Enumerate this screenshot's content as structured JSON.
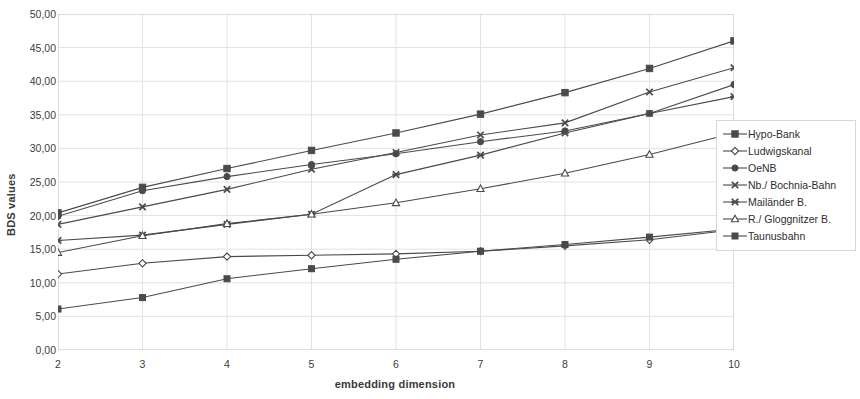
{
  "chart_data": {
    "type": "line",
    "title": "",
    "xlabel": "embedding dimension",
    "ylabel": "BDS values",
    "x": [
      2,
      3,
      4,
      5,
      6,
      7,
      8,
      9,
      10
    ],
    "xlim": [
      2,
      10
    ],
    "ylim": [
      0,
      50
    ],
    "xtick_labels": [
      "2",
      "3",
      "4",
      "5",
      "6",
      "7",
      "8",
      "9",
      "10"
    ],
    "ytick_labels": [
      "0,00",
      "5,00",
      "10,00",
      "15,00",
      "20,00",
      "25,00",
      "30,00",
      "35,00",
      "40,00",
      "45,00",
      "50,00"
    ],
    "ytick_values": [
      0,
      5,
      10,
      15,
      20,
      25,
      30,
      35,
      40,
      45,
      50
    ],
    "grid": true,
    "legend_position": "right",
    "series": [
      {
        "name": "Hypo-Bank",
        "marker": "filled-square",
        "values": [
          20.4,
          24.2,
          27.0,
          29.7,
          32.3,
          35.1,
          38.3,
          41.9,
          46.0
        ]
      },
      {
        "name": "Ludwigskanal",
        "marker": "open-diamond",
        "values": [
          11.3,
          12.9,
          13.9,
          14.1,
          14.3,
          14.7,
          15.5,
          16.4,
          17.9
        ]
      },
      {
        "name": "OeNB",
        "marker": "filled-circle",
        "values": [
          19.9,
          23.7,
          25.8,
          27.6,
          29.2,
          31.0,
          32.6,
          35.2,
          39.5
        ]
      },
      {
        "name": "Nb./ Bochnia-Bahn",
        "marker": "x-cross",
        "values": [
          18.7,
          21.3,
          23.9,
          26.9,
          29.4,
          32.0,
          33.8,
          38.4,
          42.0
        ]
      },
      {
        "name": "Mailänder B.",
        "marker": "star-cross",
        "values": [
          16.3,
          17.1,
          18.7,
          20.2,
          26.1,
          29.0,
          32.3,
          35.2,
          37.7
        ]
      },
      {
        "name": "R./ Gloggnitzer B.",
        "marker": "open-triangle",
        "values": [
          14.5,
          17.0,
          18.8,
          20.2,
          21.9,
          24.0,
          26.3,
          29.1,
          32.3
        ]
      },
      {
        "name": "Taunusbahn",
        "marker": "filled-square-small",
        "values": [
          6.1,
          7.8,
          10.6,
          12.1,
          13.5,
          14.7,
          15.7,
          16.8,
          18.0
        ]
      }
    ]
  },
  "legend": {
    "items": [
      {
        "label": "Hypo-Bank"
      },
      {
        "label": "Ludwigskanal"
      },
      {
        "label": "OeNB"
      },
      {
        "label": "Nb./ Bochnia-Bahn"
      },
      {
        "label": "Mailänder B."
      },
      {
        "label": "R./ Gloggnitzer B."
      },
      {
        "label": "Taunusbahn"
      }
    ]
  },
  "colors": {
    "line": "#4a4a4a",
    "grid": "#e2e2e2",
    "axis": "#c8c8c8",
    "text": "#2e2e2e"
  }
}
